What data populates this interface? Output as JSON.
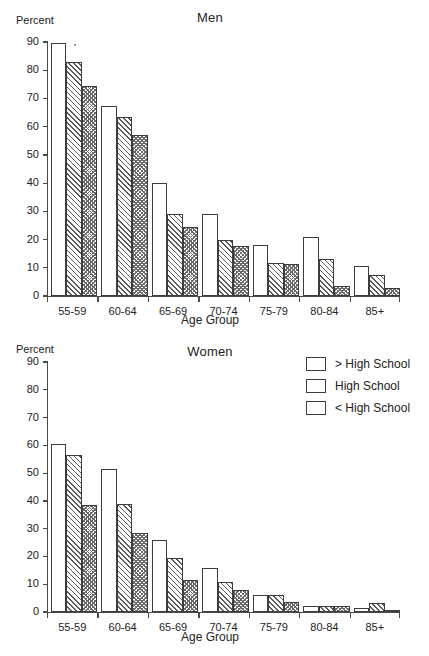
{
  "figure": {
    "panels": [
      "Men",
      "Women"
    ],
    "legend_position": "top-right of Women panel"
  },
  "legend": {
    "items": [
      {
        "label": "> High School",
        "pattern": "none"
      },
      {
        "label": "High School",
        "pattern": "diagonal"
      },
      {
        "label": "< High School",
        "pattern": "cross-hatch"
      }
    ]
  },
  "chart_data": [
    {
      "type": "bar",
      "title": "Men",
      "xlabel": "Age Group",
      "ylabel": "Percent",
      "ylim": [
        0,
        90
      ],
      "yticks": [
        0,
        10,
        20,
        30,
        40,
        50,
        60,
        70,
        80,
        90
      ],
      "grid": false,
      "categories": [
        "55-59",
        "60-64",
        "65-69",
        "70-74",
        "75-79",
        "80-84",
        "85+"
      ],
      "series": [
        {
          "name": "> High School",
          "pattern": "none",
          "values": [
            89.5,
            67.5,
            40.0,
            29.0,
            18.0,
            21.0,
            10.5
          ]
        },
        {
          "name": "High School",
          "pattern": "diagonal",
          "values": [
            83.0,
            63.5,
            29.0,
            20.0,
            11.8,
            13.0,
            7.5
          ]
        },
        {
          "name": "< High School",
          "pattern": "cross-hatch",
          "values": [
            74.5,
            57.0,
            24.5,
            17.8,
            11.5,
            3.7,
            2.7
          ]
        }
      ]
    },
    {
      "type": "bar",
      "title": "Women",
      "xlabel": "Age Group",
      "ylabel": "Percent",
      "ylim": [
        0,
        90
      ],
      "yticks": [
        0,
        10,
        20,
        30,
        40,
        50,
        60,
        70,
        80,
        90
      ],
      "grid": false,
      "categories": [
        "55-59",
        "60-64",
        "65-69",
        "70-74",
        "75-79",
        "80-84",
        "85+"
      ],
      "series": [
        {
          "name": "> High School",
          "pattern": "none",
          "values": [
            60.5,
            51.5,
            26.0,
            15.8,
            6.1,
            2.3,
            1.5
          ]
        },
        {
          "name": "High School",
          "pattern": "diagonal",
          "values": [
            56.5,
            39.0,
            19.5,
            10.8,
            6.1,
            2.3,
            3.2
          ]
        },
        {
          "name": "< High School",
          "pattern": "cross-hatch",
          "values": [
            38.7,
            28.3,
            11.5,
            7.8,
            3.6,
            2.3,
            0.8
          ]
        }
      ]
    }
  ]
}
